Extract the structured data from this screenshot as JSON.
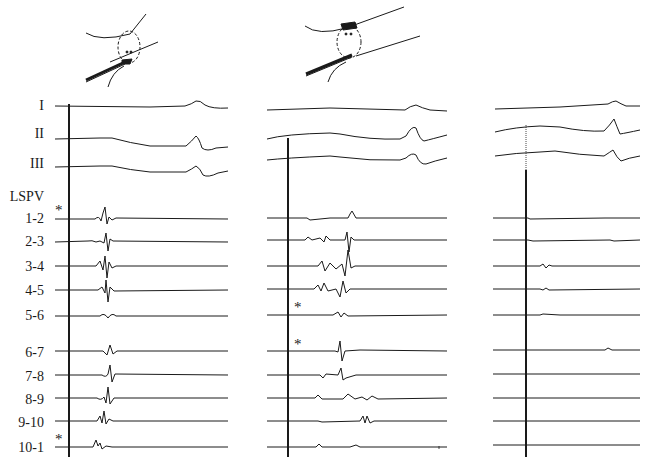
{
  "figure": {
    "type": "intracardiac electrogram recording",
    "panels": [
      {
        "id": "panel-1",
        "schematic": {
          "marker_label": "**",
          "electrode_position": "bottom wall"
        },
        "marker_stars": [
          "LSPV 1-2",
          "LSPV 10-1"
        ]
      },
      {
        "id": "panel-2",
        "schematic": {
          "marker_label": "**",
          "electrode_position": "top wall"
        },
        "marker_stars": [
          "LSPV 5-6",
          "LSPV 6-7"
        ]
      },
      {
        "id": "panel-3",
        "schematic": null,
        "marker_stars": []
      }
    ],
    "surface_leads": [
      "I",
      "II",
      "III"
    ],
    "group_label": "LSPV",
    "bipoles": [
      "1-2",
      "2-3",
      "3-4",
      "4-5",
      "5-6",
      "6-7",
      "7-8",
      "8-9",
      "9-10",
      "10-1"
    ],
    "star_symbol": "*",
    "colors": {
      "trace": "#1a1a1a",
      "background": "#ffffff"
    }
  }
}
